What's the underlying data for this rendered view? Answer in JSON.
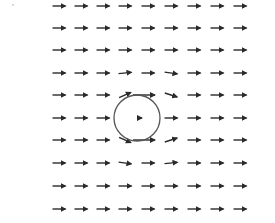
{
  "diagram": {
    "type": "vector_field",
    "arrow_color": "#2a2a2a",
    "circle_color": "#555555",
    "circle": {
      "cx": 137,
      "cy": 118,
      "r": 23
    },
    "grid": {
      "cols_x": [
        37,
        59,
        81,
        103,
        125,
        148,
        171,
        194,
        217,
        240
      ],
      "rows_y": [
        6,
        28,
        50,
        73,
        95,
        118,
        140,
        163,
        186,
        209
      ]
    },
    "arrow_length": 13,
    "special_arrows": [
      {
        "row": 4,
        "col": 4,
        "angle": -25,
        "len": 13
      },
      {
        "row": 4,
        "col": 5,
        "angle": 0,
        "len": 22,
        "dx": -4
      },
      {
        "row": 4,
        "col": 6,
        "angle": 18,
        "len": 13
      },
      {
        "row": 3,
        "col": 6,
        "angle": 8,
        "len": 13
      },
      {
        "row": 3,
        "col": 4,
        "angle": -5,
        "len": 13
      },
      {
        "row": 5,
        "col": 5,
        "angle": 0,
        "len": 4,
        "dx": -8
      },
      {
        "row": 6,
        "col": 4,
        "angle": 25,
        "len": 13
      },
      {
        "row": 6,
        "col": 5,
        "angle": 0,
        "len": 22,
        "dx": -4
      },
      {
        "row": 6,
        "col": 6,
        "angle": -18,
        "len": 13
      },
      {
        "row": 7,
        "col": 4,
        "angle": 8,
        "len": 13
      },
      {
        "row": 7,
        "col": 6,
        "angle": -5,
        "len": 13
      }
    ],
    "hidden_cells": [
      {
        "row": 5,
        "col": 4
      },
      {
        "row": 0,
        "col": 0
      },
      {
        "row": 1,
        "col": 0
      },
      {
        "row": 2,
        "col": 0
      },
      {
        "row": 3,
        "col": 0
      },
      {
        "row": 4,
        "col": 0
      },
      {
        "row": 5,
        "col": 0
      },
      {
        "row": 6,
        "col": 0
      },
      {
        "row": 7,
        "col": 0
      },
      {
        "row": 8,
        "col": 0
      },
      {
        "row": 9,
        "col": 0
      }
    ]
  }
}
